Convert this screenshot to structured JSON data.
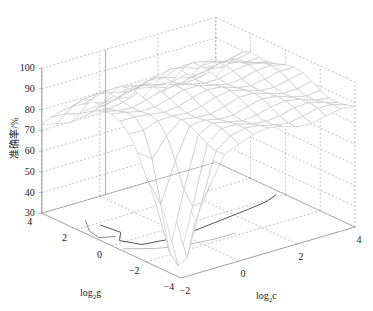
{
  "chart_data": {
    "type": "surface",
    "title": "",
    "xlabel": "log2c",
    "ylabel": "log2g",
    "zlabel": "准确率/%",
    "xlim": [
      -2,
      4
    ],
    "ylim": [
      -4,
      4
    ],
    "zlim": [
      30,
      100
    ],
    "x_ticks": [
      "-2",
      "0",
      "2",
      "4"
    ],
    "y_ticks": [
      "-4",
      "-2",
      "0",
      "2",
      "4"
    ],
    "z_ticks": [
      "30",
      "40",
      "50",
      "60",
      "70",
      "80",
      "90",
      "100"
    ],
    "grid": true,
    "c_values": [
      -2,
      -1.5,
      -1,
      -0.5,
      0,
      0.5,
      1,
      1.5,
      2,
      2.5,
      3,
      3.5,
      4
    ],
    "g_values": [
      -4,
      -3.5,
      -3,
      -2.5,
      -2,
      -1.5,
      -1,
      -0.5,
      0,
      0.5,
      1,
      1.5,
      2,
      2.5,
      3,
      3.5,
      4
    ],
    "accuracy_note": "Accuracy surface: plateau ~85-95% for mid g, sharp drop to ~30% near c=-2..-1, g=-4..-2; ~70% at g=4, c=-2",
    "contours": [
      {
        "level": 50,
        "color": "#555555"
      },
      {
        "level": 40,
        "color": "#888888"
      },
      {
        "level": 35,
        "color": "#bbbbbb"
      }
    ]
  },
  "labels": {
    "zlabel": "准确率/%",
    "xlabel_base": "log",
    "xlabel_sub": "2",
    "xlabel_var": "c",
    "ylabel_base": "log",
    "ylabel_sub": "2",
    "ylabel_var": "g"
  },
  "colors": {
    "surface_edge": "#c8c8c8",
    "box": "#888888",
    "grid": "#999999"
  }
}
